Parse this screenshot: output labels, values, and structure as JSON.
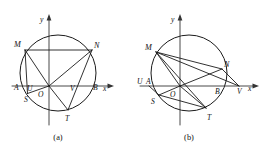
{
  "figure": {
    "panels": [
      {
        "id": "panel-a",
        "caption": "(a)",
        "axis": {
          "x_label": "x",
          "y_label": "y"
        },
        "origin_label": "O",
        "points": [
          {
            "name": "M",
            "label": "M"
          },
          {
            "name": "N",
            "label": "N"
          },
          {
            "name": "A",
            "label": "A"
          },
          {
            "name": "B",
            "label": "B"
          },
          {
            "name": "U",
            "label": "U"
          },
          {
            "name": "V",
            "label": "V"
          },
          {
            "name": "S",
            "label": "S"
          },
          {
            "name": "T",
            "label": "T"
          }
        ]
      },
      {
        "id": "panel-b",
        "caption": "(b)",
        "axis": {
          "x_label": "x",
          "y_label": "y"
        },
        "origin_label": "O",
        "points": [
          {
            "name": "M",
            "label": "M"
          },
          {
            "name": "N",
            "label": "N"
          },
          {
            "name": "A",
            "label": "A"
          },
          {
            "name": "B",
            "label": "B"
          },
          {
            "name": "U",
            "label": "U"
          },
          {
            "name": "V",
            "label": "V"
          },
          {
            "name": "S",
            "label": "S"
          },
          {
            "name": "T",
            "label": "T"
          }
        ]
      }
    ]
  },
  "colors": {
    "ink": "#1b1b1b",
    "axis": "#333333",
    "background": "#ffffff"
  }
}
